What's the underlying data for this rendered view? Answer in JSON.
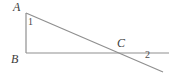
{
  "figure": {
    "kind": "geometry-diagram",
    "width": 173,
    "height": 82,
    "background_color": "#ffffff",
    "stroke_color": "#8a8a8a",
    "label_color": "#3b3b3b",
    "points": {
      "A": {
        "x": 26,
        "y": 13
      },
      "B": {
        "x": 26,
        "y": 53
      },
      "C": {
        "x": 115,
        "y": 53
      }
    },
    "segments": [
      {
        "name": "side-AB",
        "x1": 26,
        "y1": 13,
        "x2": 26,
        "y2": 53
      },
      {
        "name": "ray-B-right",
        "x1": 26,
        "y1": 53,
        "x2": 169,
        "y2": 53
      },
      {
        "name": "transversal-A-through-C",
        "x1": 26,
        "y1": 13,
        "x2": 163,
        "y2": 72
      }
    ],
    "labels": {
      "vertex_A": "A",
      "vertex_B": "B",
      "vertex_C": "C",
      "angle_1": "1",
      "angle_2": "2"
    }
  }
}
